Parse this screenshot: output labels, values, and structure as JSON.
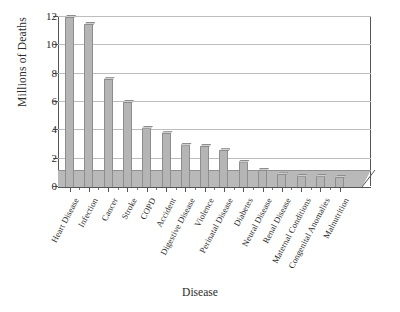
{
  "chart_data": {
    "type": "bar",
    "title": "",
    "xlabel": "Disease",
    "ylabel": "Millions of Deaths",
    "categories": [
      "Heart Disease",
      "Infection",
      "Cancer",
      "Stroke",
      "COPD",
      "Accident",
      "Digestive Disease",
      "Violence",
      "Perinatal Disease",
      "Diabetes",
      "Neural Disease",
      "Renal Disease",
      "Maternal Conditions",
      "Congenital Anomalies",
      "Malnutrition"
    ],
    "values": [
      12.0,
      11.5,
      7.6,
      6.0,
      4.2,
      3.8,
      3.0,
      2.9,
      2.6,
      1.8,
      1.2,
      0.9,
      0.8,
      0.8,
      0.7
    ],
    "ylim": [
      0,
      12
    ],
    "yticks": [
      0,
      2,
      4,
      6,
      8,
      10,
      12
    ],
    "ytick_labels": [
      "0",
      "2",
      "4",
      "6",
      "8",
      "10",
      "12"
    ],
    "grid": "horizontal",
    "legend": "none",
    "bar_color": "#b5b5b5",
    "bar_edge_color": "#8d8d8d",
    "grid_color": "#bdbdbd",
    "axis_color": "#555555",
    "background": "#ffffff"
  }
}
